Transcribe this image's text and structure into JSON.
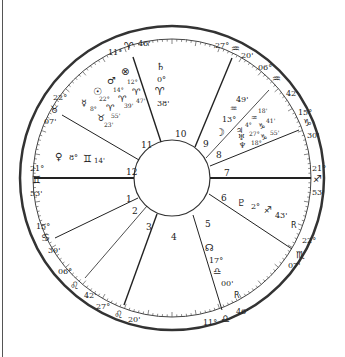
{
  "chart": {
    "center": [
      172,
      178
    ],
    "outer_radius": 152,
    "band_radius": 140,
    "inner_radius": 38
  },
  "house_numbers": [
    "1",
    "2",
    "3",
    "4",
    "5",
    "6",
    "7",
    "8",
    "9",
    "10",
    "11",
    "12"
  ],
  "cusps": [
    {
      "house": "10",
      "deg": "11°",
      "sign": "♈",
      "min": "46'"
    },
    {
      "house": "9",
      "deg": "27°",
      "sign": "♒",
      "min": "20'"
    },
    {
      "house": "8",
      "deg": "06°",
      "sign": "♒",
      "min": "42'"
    },
    {
      "house": "7a",
      "deg": "15°",
      "sign": "♑",
      "min": "30'"
    },
    {
      "house": "7",
      "deg": "21°",
      "sign": "♐",
      "min": "53'"
    },
    {
      "house": "6",
      "deg": "22°",
      "sign": "♏",
      "min": "07'"
    },
    {
      "house": "4",
      "deg": "11°",
      "sign": "♎",
      "min": "46'"
    },
    {
      "house": "3",
      "deg": "27°",
      "sign": "♌",
      "min": "20'"
    },
    {
      "house": "2",
      "deg": "06°",
      "sign": "♌",
      "min": "42'"
    },
    {
      "house": "1a",
      "deg": "15°",
      "sign": "♋",
      "min": "30'"
    },
    {
      "house": "1",
      "deg": "21°",
      "sign": "♊",
      "min": "53'"
    },
    {
      "house": "12",
      "deg": "22°",
      "sign": "♉",
      "min": "07'"
    }
  ],
  "planets": [
    {
      "name": "saturn",
      "glyph": "♄",
      "deg": "0°",
      "sign": "♈",
      "min": "38'"
    },
    {
      "name": "part-of-fortune",
      "glyph": "⊗",
      "deg": "12°",
      "sign": "♈",
      "min": "47'"
    },
    {
      "name": "mars",
      "glyph": "♂",
      "deg": "14°",
      "sign": "♈",
      "min": "39'"
    },
    {
      "name": "sun",
      "glyph": "☉",
      "deg": "22°",
      "sign": "♈",
      "min": "55'"
    },
    {
      "name": "mercury",
      "glyph": "☿",
      "deg": "8°",
      "sign": "♉",
      "min": "23'"
    },
    {
      "name": "venus",
      "glyph": "♀",
      "deg": "8°",
      "sign": "♊",
      "min": "14'"
    },
    {
      "name": "moon",
      "glyph": "☽",
      "deg": "13°",
      "sign": "♒",
      "min": "49'"
    },
    {
      "name": "jupiter",
      "glyph": "♃",
      "deg": "4°",
      "sign": "♒",
      "min": "18'"
    },
    {
      "name": "uranus",
      "glyph": "♅",
      "deg": "27°",
      "sign": "♑",
      "min": "41'"
    },
    {
      "name": "neptune",
      "glyph": "♆",
      "deg": "18°",
      "sign": "♑",
      "min": "55'"
    },
    {
      "name": "pluto",
      "glyph": "♇",
      "deg": "2°",
      "sign": "♐",
      "min": "43'",
      "retro": "R"
    },
    {
      "name": "north-node",
      "glyph": "☊",
      "deg": "17°",
      "sign": "♎",
      "min": "00'",
      "retro": "R"
    }
  ]
}
